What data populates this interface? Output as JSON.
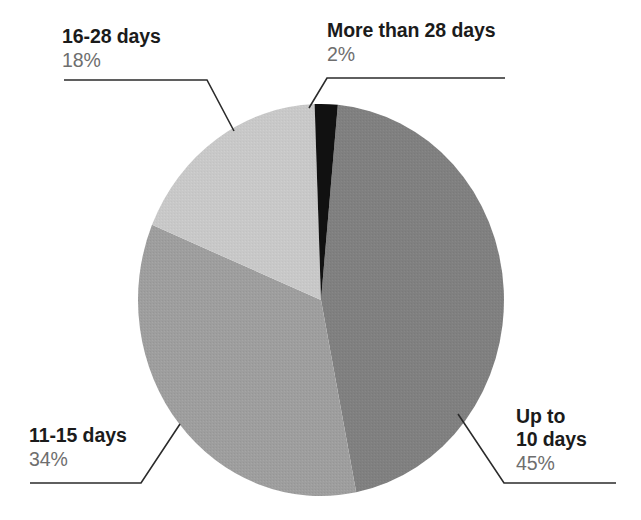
{
  "chart_data": {
    "type": "pie",
    "title": "",
    "subtitle": "",
    "xlabel": "",
    "ylabel": "",
    "legend_position": "callout-labels",
    "grid": false,
    "start_angle_deg": -92,
    "direction": "clockwise",
    "categories": [
      "More than 28 days",
      "Up to 10 days",
      "11-15 days",
      "16-28 days"
    ],
    "values": [
      2,
      45,
      34,
      18
    ],
    "value_labels": [
      "2%",
      "45%",
      "34%",
      "18%"
    ],
    "colors": [
      "#111111",
      "#808080",
      "#9e9e9e",
      "#c8c8c8"
    ],
    "slices": [
      {
        "name": "more-than-28-days",
        "label": "More than 28 days",
        "value": 2,
        "value_label": "2%",
        "color": "#111111"
      },
      {
        "name": "up-to-10-days",
        "label_line1": "Up to",
        "label_line2": "10 days",
        "label": "Up to 10 days",
        "value": 45,
        "value_label": "45%",
        "color": "#808080"
      },
      {
        "name": "11-15-days",
        "label": "11-15 days",
        "value": 34,
        "value_label": "34%",
        "color": "#9e9e9e"
      },
      {
        "name": "16-28-days",
        "label": "16-28 days",
        "value": 18,
        "value_label": "18%",
        "color": "#c8c8c8"
      }
    ]
  },
  "labels": {
    "top_left": {
      "title": "16-28 days",
      "value": "18%"
    },
    "top_right": {
      "title": "More than 28 days",
      "value": "2%"
    },
    "bottom_left": {
      "title": "11-15 days",
      "value": "34%"
    },
    "bottom_right": {
      "title_line1": "Up to",
      "title_line2": "10 days",
      "value": "45%"
    }
  },
  "style": {
    "background": "#ffffff",
    "leader_line_color": "#2b2b2b",
    "title_color": "#1b1b1b",
    "value_color": "#6e6e6e"
  }
}
